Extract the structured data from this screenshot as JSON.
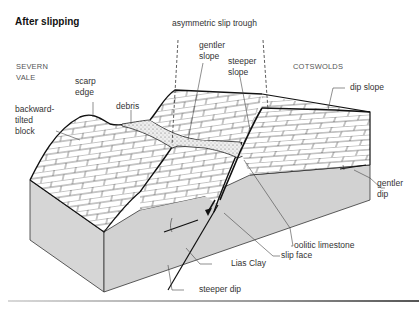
{
  "title": "After slipping",
  "regions": {
    "west": [
      "SEVERN",
      "VALE"
    ],
    "east": "COTSWOLDS"
  },
  "labels": {
    "asymmetric_slip_trough": "asymmetric slip trough",
    "gentler_slope": [
      "gentler",
      "slope"
    ],
    "steeper_slope": [
      "steeper",
      "slope"
    ],
    "scarp_edge": [
      "scarp",
      "edge"
    ],
    "backward_tilted_block": [
      "backward-",
      "tilted",
      "block"
    ],
    "debris": "debris",
    "dip_slope": "dip slope",
    "gentler_dip": [
      "gentler",
      "dip"
    ],
    "oolitic_limestone": "oolitic limestone",
    "slip_face": "slip face",
    "lias_clay": "Lias Clay",
    "steeper_dip": "steeper dip"
  },
  "colors": {
    "clay_fill": "#d4d4d4",
    "limestone_fill": "#ffffff",
    "outline": "#111111",
    "label_text": "#333333",
    "debris_fill": "#e6e6e6"
  }
}
